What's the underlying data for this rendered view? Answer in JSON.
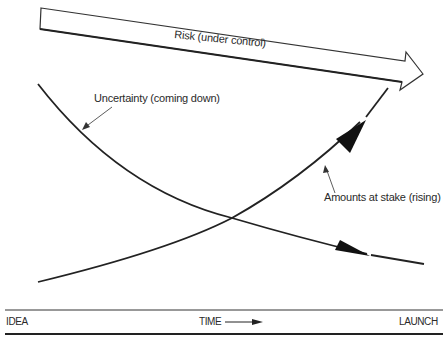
{
  "diagram": {
    "risk_arrow": {
      "label": "Risk (under control)"
    },
    "curves": [
      {
        "name": "uncertainty",
        "label": "Uncertainty (coming down)",
        "direction": "falling"
      },
      {
        "name": "amounts_at_stake",
        "label": "Amounts at stake (rising)",
        "direction": "rising"
      }
    ],
    "axis": {
      "start_label": "IDEA",
      "middle_label": "TIME",
      "end_label": "LAUNCH"
    },
    "colors": {
      "stroke": "#222222",
      "background": "#ffffff"
    }
  }
}
